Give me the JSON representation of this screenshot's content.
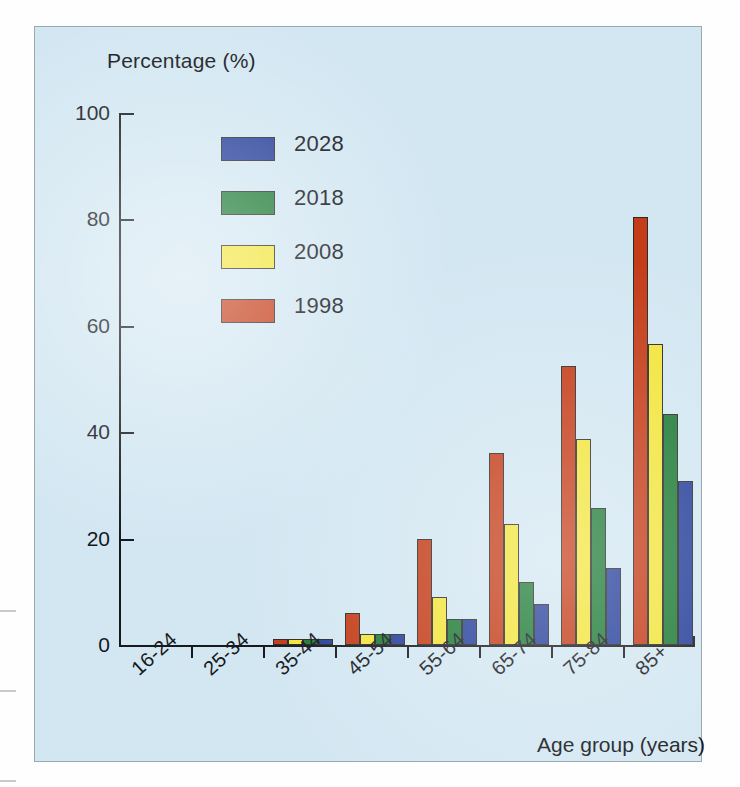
{
  "chart_data": {
    "type": "bar",
    "title": "",
    "ylabel": "Percentage (%)",
    "xlabel": "Age group (years)",
    "ylim": [
      0,
      100
    ],
    "yticks": [
      0,
      20,
      40,
      60,
      80,
      100
    ],
    "grid": false,
    "legend_position": "upper-left-inside",
    "categories": [
      "16-24",
      "25-34",
      "35-44",
      "45-54",
      "55-64",
      "65-74",
      "75-84",
      "85+"
    ],
    "series": [
      {
        "name": "2028",
        "color": "#27409A",
        "values": [
          0,
          0,
          1.2,
          2.0,
          4.8,
          7.8,
          14.5,
          30.8
        ]
      },
      {
        "name": "2018",
        "color": "#1E7B36",
        "values": [
          0,
          0,
          1.2,
          2.0,
          4.8,
          11.8,
          25.8,
          43.5
        ]
      },
      {
        "name": "2008",
        "color": "#F2E53C",
        "values": [
          0,
          0,
          1.2,
          2.0,
          9.0,
          22.8,
          38.8,
          56.5
        ]
      },
      {
        "name": "1998",
        "color": "#C43C18",
        "values": [
          0,
          0,
          1.2,
          6.0,
          20.0,
          36.0,
          52.5,
          80.5
        ]
      }
    ],
    "series_draw_order": [
      "1998",
      "2008",
      "2018",
      "2028"
    ],
    "legend_entries": [
      "2028",
      "2018",
      "2008",
      "1998"
    ]
  },
  "colors": {
    "panel_background": "#d3e7f2",
    "panel_border": "#9aa8b0",
    "axis": "#17191d",
    "text": "#16181c",
    "page_background": "#fefefe"
  }
}
